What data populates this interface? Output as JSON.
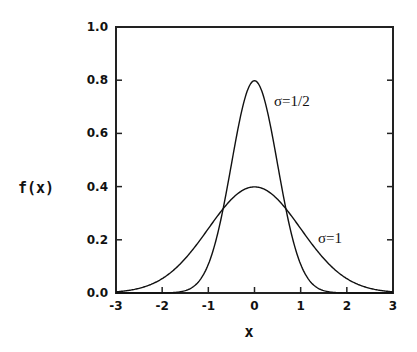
{
  "chart_data": {
    "type": "line",
    "title": "",
    "xlabel": "x",
    "ylabel": "f(x)",
    "xlim": [
      -3,
      3
    ],
    "ylim": [
      0,
      1.0
    ],
    "grid": false,
    "legend": "none (inline annotations)",
    "x_ticks": [
      "-3",
      "-2",
      "-1",
      "0",
      "1",
      "2",
      "3"
    ],
    "y_ticks": [
      "0.0",
      "0.2",
      "0.4",
      "0.6",
      "0.8",
      "1.0"
    ],
    "x": [
      -3,
      -2.5,
      -2,
      -1.5,
      -1,
      -0.75,
      -0.5,
      -0.25,
      0,
      0.25,
      0.5,
      0.75,
      1,
      1.5,
      2,
      2.5,
      3
    ],
    "series": [
      {
        "name": "σ=1/2",
        "sigma": 0.5,
        "values": [
          0.0,
          0.0,
          0.0003,
          0.0089,
          0.108,
          0.259,
          0.4839,
          0.7041,
          0.7979,
          0.7041,
          0.4839,
          0.259,
          0.108,
          0.0089,
          0.0003,
          0.0,
          0.0
        ]
      },
      {
        "name": "σ=1",
        "sigma": 1,
        "values": [
          0.0044,
          0.0175,
          0.054,
          0.1295,
          0.242,
          0.3011,
          0.3521,
          0.3867,
          0.3989,
          0.3867,
          0.3521,
          0.3011,
          0.242,
          0.1295,
          0.054,
          0.0175,
          0.0044
        ]
      }
    ],
    "annotations": [
      {
        "text": "σ=1/2",
        "x": 0.35,
        "y": 0.62
      },
      {
        "text": "σ=1",
        "x": 1.6,
        "y": 0.15
      }
    ]
  },
  "labels": {
    "ylabel": "f(x)",
    "xlabel": "x",
    "annot_narrow": "σ=1/2",
    "annot_wide": "σ=1"
  }
}
